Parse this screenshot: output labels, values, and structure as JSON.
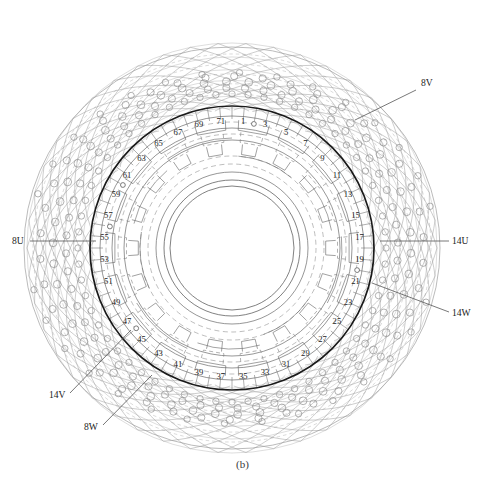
{
  "figure": {
    "caption": "(b)",
    "type": "stator-cross-section-with-end-winding"
  },
  "colors": {
    "bore_circle": "#1a1a1a",
    "inner_lines": "#5a5a5a",
    "mesh_lines": "#9a9a9a",
    "conductor_circles": "#8e8e8e",
    "dashed_lines": "#7a7a7a",
    "text": "#222222",
    "background": "#ffffff"
  },
  "geometry": {
    "center_x": 232,
    "center_y": 248,
    "bore_radius": 142,
    "inner_bore_radius": 62,
    "outer_mesh_radius": 205,
    "slot_label_radius": 128,
    "slot_count": 72,
    "label_start_angle_deg": -90
  },
  "slot_numbers": [
    "1",
    "3",
    "5",
    "7",
    "9",
    "11",
    "13",
    "15",
    "17",
    "19",
    "21",
    "23",
    "25",
    "27",
    "29",
    "31",
    "33",
    "35",
    "37",
    "39",
    "41",
    "43",
    "45",
    "47",
    "49",
    "51",
    "53",
    "55",
    "57",
    "59",
    "61",
    "63",
    "65",
    "67",
    "69",
    "71"
  ],
  "callouts": [
    {
      "label": "8V",
      "text_x": 421,
      "text_y": 86,
      "lx1": 416,
      "ly1": 90,
      "lx2": 355,
      "ly2": 120
    },
    {
      "label": "14U",
      "text_x": 452,
      "text_y": 244,
      "lx1": 449,
      "ly1": 241,
      "lx2": 380,
      "ly2": 241
    },
    {
      "label": "14W",
      "text_x": 452,
      "text_y": 316,
      "lx1": 449,
      "ly1": 312,
      "lx2": 372,
      "ly2": 283
    },
    {
      "label": "8U",
      "text_x": 12,
      "text_y": 244,
      "lx1": 30,
      "ly1": 241,
      "lx2": 96,
      "ly2": 241
    },
    {
      "label": "14V",
      "text_x": 49,
      "text_y": 398,
      "lx1": 70,
      "ly1": 393,
      "lx2": 131,
      "ly2": 330
    },
    {
      "label": "8W",
      "text_x": 84,
      "text_y": 430,
      "lx1": 103,
      "ly1": 425,
      "lx2": 152,
      "ly2": 375
    }
  ]
}
